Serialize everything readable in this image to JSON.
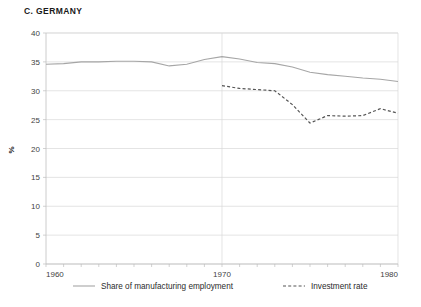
{
  "chart_data": {
    "type": "line",
    "title": "C. GERMANY",
    "xlabel": "",
    "ylabel": "%",
    "xlim": [
      1960,
      1980
    ],
    "ylim": [
      0,
      40
    ],
    "y_ticks": [
      0,
      5,
      10,
      15,
      20,
      25,
      30,
      35,
      40
    ],
    "x_ticks": [
      1960,
      1970,
      1980
    ],
    "x_tick_labels": [
      "1960",
      "1970",
      "1980"
    ],
    "y_tick_labels": [
      "0",
      "5",
      "10",
      "15",
      "20",
      "25",
      "30",
      "35",
      "40"
    ],
    "grid": "horizontal-and-1970-vertical",
    "legend_position": "bottom",
    "x": [
      1960,
      1961,
      1962,
      1963,
      1964,
      1965,
      1966,
      1967,
      1968,
      1969,
      1970,
      1971,
      1972,
      1973,
      1974,
      1975,
      1976,
      1977,
      1978,
      1979,
      1980
    ],
    "series": [
      {
        "name": "Share of manufacturing employment",
        "style": "solid",
        "color": "#a6a6a6",
        "values": [
          34.6,
          34.7,
          35.0,
          35.0,
          35.1,
          35.1,
          35.0,
          34.3,
          34.6,
          35.4,
          35.9,
          35.5,
          34.9,
          34.7,
          34.1,
          33.2,
          32.8,
          32.5,
          32.2,
          32.0,
          31.6
        ]
      },
      {
        "name": "Investment rate",
        "style": "dashed",
        "color": "#555555",
        "values": [
          null,
          null,
          null,
          null,
          null,
          null,
          null,
          null,
          null,
          null,
          30.9,
          30.4,
          30.2,
          30.0,
          27.6,
          24.4,
          25.7,
          25.6,
          25.7,
          26.9,
          26.1
        ]
      }
    ],
    "legend": [
      {
        "label": "Share of manufacturing employment",
        "style": "solid",
        "color": "#a6a6a6"
      },
      {
        "label": "Investment rate",
        "style": "dashed",
        "color": "#555555"
      }
    ]
  }
}
